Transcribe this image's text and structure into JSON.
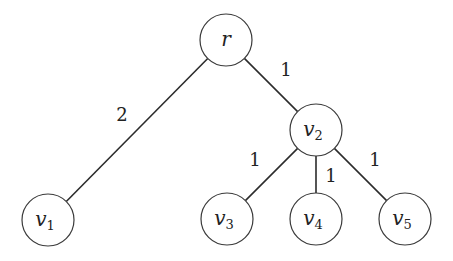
{
  "diagram": {
    "type": "weighted-tree",
    "colors": {
      "stroke": "#2b2b2b",
      "node_fill": "#ffffff",
      "text": "#222222"
    },
    "nodes": [
      {
        "id": "r",
        "label": "r",
        "sub": "",
        "x": 226,
        "y": 40,
        "r": 26
      },
      {
        "id": "v1",
        "label": "v",
        "sub": "1",
        "x": 48,
        "y": 220,
        "r": 26
      },
      {
        "id": "v2",
        "label": "v",
        "sub": "2",
        "x": 316,
        "y": 130,
        "r": 26
      },
      {
        "id": "v3",
        "label": "v",
        "sub": "3",
        "x": 227,
        "y": 219,
        "r": 26
      },
      {
        "id": "v4",
        "label": "v",
        "sub": "4",
        "x": 316,
        "y": 219,
        "r": 26
      },
      {
        "id": "v5",
        "label": "v",
        "sub": "5",
        "x": 405,
        "y": 219,
        "r": 26
      }
    ],
    "edges": [
      {
        "from": "r",
        "to": "v1",
        "weight": "2",
        "lx": 122,
        "ly": 121
      },
      {
        "from": "r",
        "to": "v2",
        "weight": "1",
        "lx": 286,
        "ly": 76
      },
      {
        "from": "v2",
        "to": "v3",
        "weight": "1",
        "lx": 255,
        "ly": 166
      },
      {
        "from": "v2",
        "to": "v4",
        "weight": "1",
        "lx": 331,
        "ly": 182
      },
      {
        "from": "v2",
        "to": "v5",
        "weight": "1",
        "lx": 375,
        "ly": 166
      }
    ]
  }
}
